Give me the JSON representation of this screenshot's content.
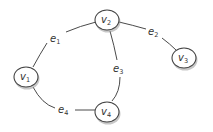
{
  "diagram": {
    "type": "graph",
    "nodes": [
      {
        "id": "v1",
        "letter": "v",
        "sub": "1",
        "x": 26,
        "y": 77
      },
      {
        "id": "v2",
        "letter": "v",
        "sub": "2",
        "x": 107,
        "y": 20
      },
      {
        "id": "v3",
        "letter": "v",
        "sub": "3",
        "x": 184,
        "y": 58
      },
      {
        "id": "v4",
        "letter": "v",
        "sub": "4",
        "x": 107,
        "y": 112
      }
    ],
    "edges": [
      {
        "id": "e1",
        "letter": "e",
        "sub": "1",
        "from": "v1",
        "to": "v2"
      },
      {
        "id": "e2",
        "letter": "e",
        "sub": "2",
        "from": "v2",
        "to": "v3"
      },
      {
        "id": "e3",
        "letter": "e",
        "sub": "3",
        "from": "v2",
        "to": "v4"
      },
      {
        "id": "e4",
        "letter": "e",
        "sub": "4",
        "from": "v1",
        "to": "v4"
      }
    ]
  }
}
